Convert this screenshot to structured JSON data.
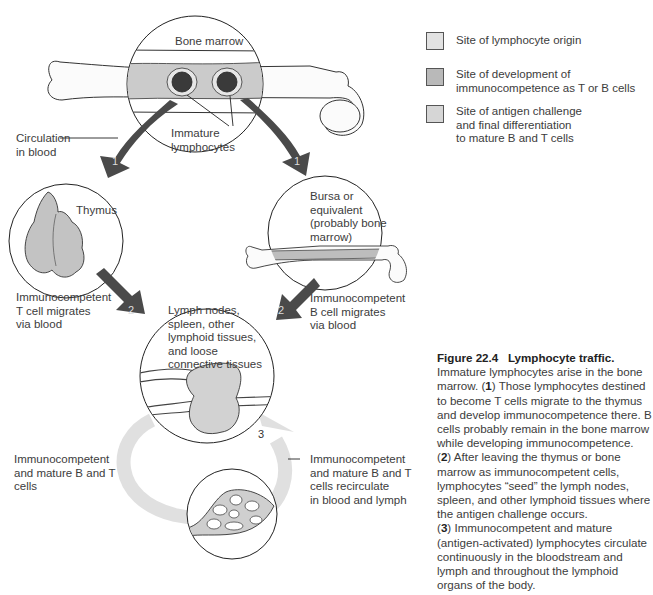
{
  "figure": {
    "number": "Figure 22.4",
    "title": "Lymphocyte traffic.",
    "caption_paragraphs": [
      "Immature lymphocytes arise in the bone marrow. (1) Those lymphocytes destined to become T cells migrate to the thymus and develop immunocompetence there. B cells probably remain in the bone marrow while developing immunocompetence.",
      "(2) After leaving the thymus or bone marrow as immunocompetent cells, lymphocytes \"seed\" the lymph nodes, spleen, and other lymphoid tissues where the antigen challenge occurs.",
      "(3) Immunocompetent and mature (antigen-activated) lymphocytes circulate continuously in the bloodstream and lymph and throughout the lymphoid organs of the body."
    ],
    "caption_parts": {
      "p1_a": "Immature lymphocytes arise in the bone marrow. (",
      "p1_n": "1",
      "p1_b": ") Those lymphocytes destined to become T cells migrate to the thymus and develop immunocompetence there. B cells probably remain in the bone marrow while developing immunocompetence.",
      "p2_open": "(",
      "p2_n": "2",
      "p2_b": ") After leaving the thymus or bone marrow as immunocompetent cells, lymphocytes “seed” the lymph nodes, spleen, and other lymphoid tissues where the antigen challenge occurs.",
      "p3_open": "(",
      "p3_n": "3",
      "p3_b": ") Immunocompetent and mature (antigen-activated) lymphocytes circulate continuously in the bloodstream and lymph and throughout the lymphoid organs of the body."
    }
  },
  "legend": {
    "items": [
      {
        "label": "Site of lymphocyte origin",
        "color": "#e2e2e2"
      },
      {
        "label": "Site of development of\nimmunocompetence as T or B cells",
        "color": "#b9b9b9"
      },
      {
        "label": "Site of antigen challenge\nand final differentiation\nto mature B and T cells",
        "color": "#d6d6d6"
      }
    ]
  },
  "labels": {
    "bone_marrow": "Bone marrow",
    "immature_lymphocytes": "Immature\nlymphocytes",
    "circulation_in_blood": "Circulation\nin blood",
    "thymus": "Thymus",
    "bursa": "Bursa or\nequivalent\n(probably bone\nmarrow)",
    "t_cell_migrates": "Immunocompetent\nT cell migrates\nvia blood",
    "b_cell_migrates": "Immunocompetent\nB cell migrates\nvia blood",
    "lymph_nodes": "Lymph nodes,\nspleen, other\nlymphoid tissues,\nand loose\nconnective tissues",
    "mature_b_t_cells": "Immunocompetent\nand mature B and T\ncells",
    "recirculate": "Immunocompetent\nand mature B and T\ncells recirculate\nin blood and lymph"
  },
  "arrows": {
    "step1_left": "1",
    "step1_right": "1",
    "step2_left": "2",
    "step2_right": "2",
    "step3": "3"
  },
  "colors": {
    "arrow_dark": "#4a4a4a",
    "marrow_band": "#c9c9c9",
    "recirculation_arrow": "#e0e0e0",
    "tissue_fill": "#c8c8c8",
    "outline": "#222222"
  }
}
